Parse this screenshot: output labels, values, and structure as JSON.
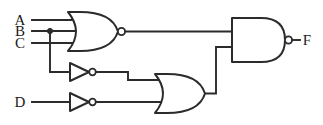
{
  "diagram": {
    "type": "logic-gate-schematic",
    "stroke_color": "#2b2b2b",
    "background_color": "#ffffff",
    "canvas": {
      "width": 323,
      "height": 125
    }
  },
  "labels": {
    "input_a": "A",
    "input_b": "B",
    "input_c": "C",
    "input_d": "D",
    "output_f": "F"
  },
  "inputs": [
    {
      "id": "A",
      "label": "A",
      "x": 20,
      "y": 20
    },
    {
      "id": "B",
      "label": "B",
      "x": 20,
      "y": 31
    },
    {
      "id": "C",
      "label": "C",
      "x": 20,
      "y": 43
    },
    {
      "id": "D",
      "label": "D",
      "x": 20,
      "y": 102
    }
  ],
  "outputs": [
    {
      "id": "F",
      "label": "F",
      "x": 305,
      "y": 40
    }
  ],
  "gates": [
    {
      "id": "nor1",
      "type": "NOR",
      "label": "3-input NOR gate",
      "inputs": [
        "A",
        "B",
        "C"
      ],
      "output": "nor1_out",
      "inverted_output": true
    },
    {
      "id": "not1",
      "type": "NOT",
      "label": "inverter on B branch",
      "inputs": [
        "B"
      ],
      "output": "not1_out",
      "inverted_output": true
    },
    {
      "id": "not2",
      "type": "NOT",
      "label": "inverter on D",
      "inputs": [
        "D"
      ],
      "output": "not2_out",
      "inverted_output": true
    },
    {
      "id": "or1",
      "type": "OR",
      "label": "2-input OR gate",
      "inputs": [
        "not1_out",
        "not2_out"
      ],
      "output": "or1_out",
      "inverted_output": false
    },
    {
      "id": "nand1",
      "type": "NAND",
      "label": "2-input NAND gate",
      "inputs": [
        "nor1_out",
        "or1_out"
      ],
      "output": "F",
      "inverted_output": true
    }
  ],
  "junctions": [
    {
      "id": "b-tap",
      "on_net": "B",
      "x": 50,
      "y": 31
    }
  ]
}
